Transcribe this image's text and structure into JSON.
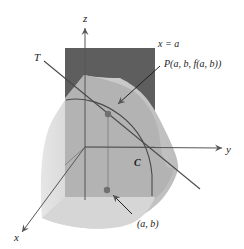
{
  "figure": {
    "type": "3d-surface-trace-diagram",
    "labels": {
      "z_axis": "z",
      "y_axis": "y",
      "x_axis": "x",
      "tangent_line": "T",
      "plane": "x = a",
      "point_P": "P(a, b, f(a, b))",
      "curve": "C",
      "point_ab": "(a, b)"
    },
    "colors": {
      "plane": "#5e5e5e",
      "surface_dark": "#a9a9a9",
      "surface_light": "#cfcfcf",
      "surface_edge": "#e4e4e4",
      "axis": "#555555",
      "point": "#6f6f6f",
      "line": "#4a4a4a"
    }
  }
}
